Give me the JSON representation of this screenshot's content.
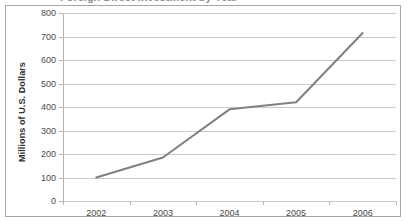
{
  "clipped_title": "Foreign Direct Investment by Year",
  "chart_data": {
    "type": "line",
    "title": "",
    "xlabel": "",
    "ylabel": "Millions of U.S. Dollars",
    "categories": [
      "2002",
      "2003",
      "2004",
      "2005",
      "2006"
    ],
    "values": [
      100,
      185,
      390,
      420,
      715
    ],
    "series": [
      {
        "name": "Millions of U.S. Dollars",
        "values": [
          100,
          185,
          390,
          420,
          715
        ],
        "color": "#808080"
      }
    ],
    "ylim": [
      0,
      800
    ],
    "yticks": [
      0,
      100,
      200,
      300,
      400,
      500,
      600,
      700,
      800
    ],
    "ytick_labels": [
      "0",
      "100",
      "200",
      "300",
      "400",
      "500",
      "600",
      "700",
      "800"
    ],
    "grid": "horizontal",
    "legend": "none",
    "line_color": "#808080",
    "gridline_color": "#c9c9c9",
    "background": "#ffffff",
    "border_color": "#a6a6a6"
  }
}
